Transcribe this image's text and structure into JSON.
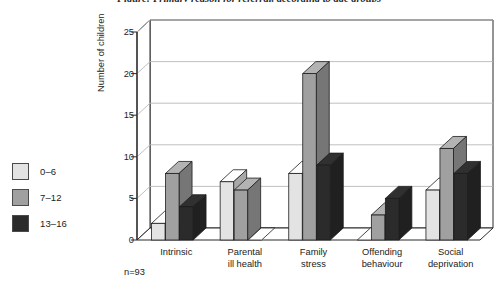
{
  "title": "Figure: Primary reason for referral, according to age groups",
  "footnote": "n=93",
  "legend": {
    "items": [
      {
        "label": "0–6",
        "color": "#e3e3e3"
      },
      {
        "label": "7–12",
        "color": "#a0a0a0"
      },
      {
        "label": "13–16",
        "color": "#2b2b2b"
      }
    ]
  },
  "chart_data": {
    "type": "bar",
    "title": "Figure: Primary reason for referral, according to age groups",
    "xlabel": "",
    "ylabel": "Number of children",
    "ylim": [
      0,
      25
    ],
    "yticks": [
      0,
      5,
      10,
      15,
      20,
      25
    ],
    "grid": true,
    "legend_position": "left",
    "style": "3d-grouped-bar",
    "categories": [
      "Intrinsic",
      "Parental ill health",
      "Family stress",
      "Offending behaviour",
      "Social deprivation"
    ],
    "category_lines": [
      [
        "Intrinsic"
      ],
      [
        "Parental",
        "ill health"
      ],
      [
        "Family",
        "stress"
      ],
      [
        "Offending",
        "behaviour"
      ],
      [
        "Social",
        "deprivation"
      ]
    ],
    "series": [
      {
        "name": "0–6",
        "color": "#e3e3e3",
        "values": [
          2,
          7,
          8,
          0,
          6
        ]
      },
      {
        "name": "7–12",
        "color": "#a0a0a0",
        "values": [
          8,
          6,
          20,
          3,
          11
        ]
      },
      {
        "name": "13–16",
        "color": "#2b2b2b",
        "values": [
          4,
          0,
          9,
          5,
          8
        ]
      }
    ],
    "annotations": [
      "n=93"
    ]
  },
  "colors": {
    "axis": "#2a2a2a",
    "grid": "#b5b5b5",
    "background": "#ffffff"
  }
}
